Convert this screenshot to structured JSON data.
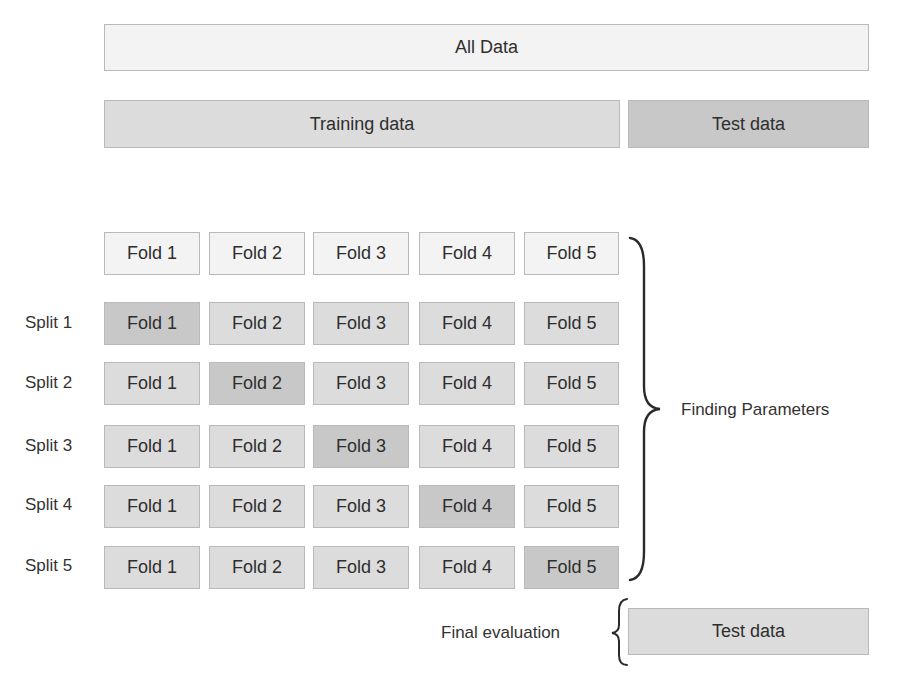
{
  "top": {
    "all_data": "All Data",
    "training_data": "Training data",
    "test_data": "Test data"
  },
  "folds_header": [
    "Fold 1",
    "Fold 2",
    "Fold 3",
    "Fold 4",
    "Fold 5"
  ],
  "splits": [
    {
      "label": "Split 1",
      "folds": [
        "Fold 1",
        "Fold 2",
        "Fold 3",
        "Fold 4",
        "Fold 5"
      ],
      "test_fold_index": 0
    },
    {
      "label": "Split 2",
      "folds": [
        "Fold 1",
        "Fold 2",
        "Fold 3",
        "Fold 4",
        "Fold 5"
      ],
      "test_fold_index": 1
    },
    {
      "label": "Split 3",
      "folds": [
        "Fold 1",
        "Fold 2",
        "Fold 3",
        "Fold 4",
        "Fold 5"
      ],
      "test_fold_index": 2
    },
    {
      "label": "Split 4",
      "folds": [
        "Fold 1",
        "Fold 2",
        "Fold 3",
        "Fold 4",
        "Fold 5"
      ],
      "test_fold_index": 3
    },
    {
      "label": "Split 5",
      "folds": [
        "Fold 1",
        "Fold 2",
        "Fold 3",
        "Fold 4",
        "Fold 5"
      ],
      "test_fold_index": 4
    }
  ],
  "annotations": {
    "finding_parameters": "Finding Parameters",
    "final_evaluation": "Final evaluation",
    "final_test_data": "Test data"
  },
  "colors": {
    "light": "#f3f3f3",
    "training": "#dcdcdc",
    "test": "#c8c8c8",
    "border": "#b9b9b9"
  }
}
